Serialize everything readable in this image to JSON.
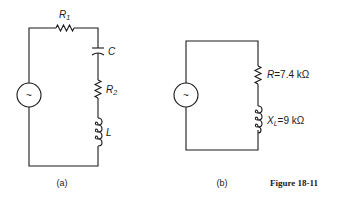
{
  "figure": {
    "title": "Figure 18-11",
    "panels": [
      {
        "caption": "(a)",
        "source_symbol": "~",
        "components": [
          {
            "type": "resistor",
            "label": "R",
            "subscript": "1"
          },
          {
            "type": "capacitor",
            "label": "C"
          },
          {
            "type": "resistor",
            "label": "R",
            "subscript": "2"
          },
          {
            "type": "inductor",
            "label": "L"
          }
        ]
      },
      {
        "caption": "(b)",
        "source_symbol": "~",
        "components": [
          {
            "type": "resistor",
            "label": "R",
            "value": "=7.4 kΩ"
          },
          {
            "type": "inductor",
            "label": "X",
            "subscript": "L",
            "value": "=9 kΩ"
          }
        ]
      }
    ]
  }
}
